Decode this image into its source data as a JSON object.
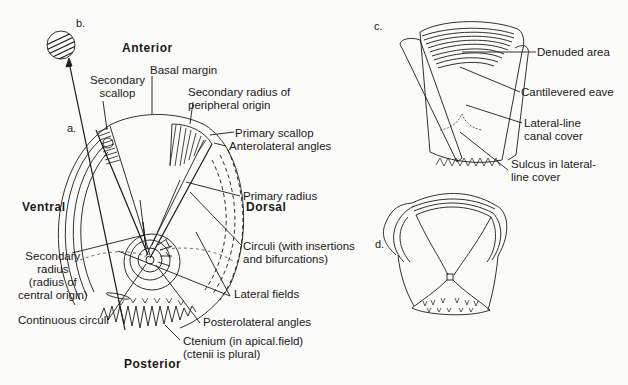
{
  "figure": {
    "panels": [
      "a.",
      "b.",
      "c.",
      "d."
    ],
    "orientation": {
      "anterior": "Anterior",
      "posterior": "Posterior",
      "ventral": "Ventral",
      "dorsal": "Dorsal"
    },
    "labels_a": {
      "secondary_scallop": [
        "Secondary",
        "scallop"
      ],
      "basal_margin": "Basal margin",
      "secondary_radius_peripheral": [
        "Secondary radius of",
        "peripheral  origin"
      ],
      "primary_scallop": "Primary scallop",
      "anterolateral_angles": "Anterolateral angles",
      "primary_radius": "Primary radius",
      "circuli": [
        "Circuli (with insertions",
        "and bifurcations)"
      ],
      "secondary_radius_central": [
        "Secondary",
        "radius",
        "(radius of",
        "central origin)"
      ],
      "lateral_fields": "Lateral fields",
      "continuous_circuli": "Continuous circuli",
      "posterolateral_angles": "Posterolateral angles",
      "ctenium": [
        "Ctenium (in apical.field)",
        "(ctenii is plural)"
      ]
    },
    "labels_c": {
      "denuded_area": "Denuded area",
      "cantilevered_eave": "Cantilevered eave",
      "lateral_line_canal_cover": [
        "Lateral-line",
        "canal cover"
      ],
      "sulcus": [
        "Sulcus in lateral-",
        "line cover"
      ]
    }
  },
  "colors": {
    "ink": "#1a1a1a",
    "background": "#fbfbf9"
  }
}
